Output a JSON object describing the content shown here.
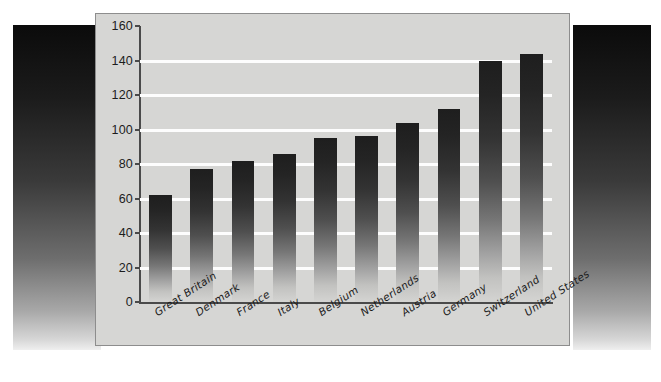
{
  "chart_data": {
    "type": "bar",
    "title": "",
    "subtitle": "",
    "xlabel": "",
    "ylabel": "",
    "ylim": [
      0,
      160
    ],
    "yticks": [
      0,
      20,
      40,
      60,
      80,
      100,
      120,
      140,
      160
    ],
    "ytick_labels": [
      "0",
      "20",
      "40",
      "60",
      "80",
      "100",
      "120",
      "140",
      "160"
    ],
    "grid": "horizontal",
    "legend": "none",
    "orientation": "vertical",
    "categories": [
      "Great Britain",
      "Denmark",
      "France",
      "Italy",
      "Belgium",
      "Netherlands",
      "Austria",
      "Germany",
      "Switzerland",
      "United States"
    ],
    "values": [
      62,
      77,
      82,
      86,
      95,
      96,
      104,
      112,
      140,
      144
    ],
    "bar_fill": "gradient-dark-to-light",
    "bar_color_top": "#1e1e1e",
    "bar_color_bottom": "#d4d4d2",
    "plot_background": "#d6d6d4",
    "gridline_color": "#fdfdfd",
    "axis_color": "#4a4a4a"
  },
  "figure": {
    "card_background": "#d6d6d4",
    "card_border_color": "#8d8d8d",
    "page_background": "#ffffff",
    "side_band_top_color": "#0b0b0b",
    "side_band_bottom_color": "#efefef"
  }
}
